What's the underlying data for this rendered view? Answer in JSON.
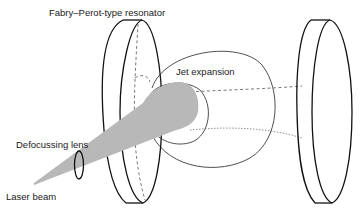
{
  "diagram": {
    "title": "Fabry–Perot-type resonator",
    "labels": {
      "resonator": "Fabry–Perot-type resonator",
      "jet": "Jet expansion",
      "lens": "Defocussing lens",
      "laser": "Laser beam"
    },
    "colors": {
      "line": "#111111",
      "beam_fill": "#b8b8b8",
      "background": "#ffffff"
    },
    "components": [
      {
        "id": "left-mirror",
        "type": "disk",
        "label": "Fabry–Perot-type resonator"
      },
      {
        "id": "right-mirror",
        "type": "disk"
      },
      {
        "id": "jet-expansion",
        "type": "ellipsoid",
        "label": "Jet expansion"
      },
      {
        "id": "defocussing-lens",
        "type": "ellipse",
        "label": "Defocussing lens"
      },
      {
        "id": "laser-beam",
        "type": "cone",
        "label": "Laser beam"
      }
    ]
  }
}
